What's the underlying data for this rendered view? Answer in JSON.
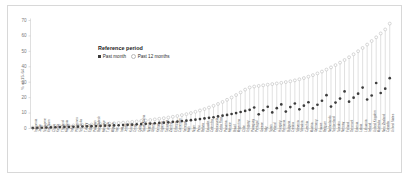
{
  "chart_data": {
    "type": "scatter",
    "title": "",
    "xlabel": "",
    "ylabel": "% of 15-64",
    "ylim": [
      0,
      70
    ],
    "yticks": [
      0,
      10,
      20,
      30,
      40,
      50,
      60,
      70
    ],
    "grid": false,
    "legend": {
      "title": "Reference period",
      "position": "upper-left-inside",
      "entries": [
        {
          "name": "Past month",
          "marker": "filled-square",
          "color": "#3b3b3b"
        },
        {
          "name": "Past 12 months",
          "marker": "open-circle",
          "color": "#b9b9b9"
        }
      ]
    },
    "categories": [
      "Indonesia",
      "Japan",
      "Singapore",
      "Viet Nam",
      "China",
      "Korea",
      "Thailand",
      "Malaysia",
      "India",
      "Philippines",
      "Sri Lanka",
      "Turkey",
      "Egypt",
      "Pakistan",
      "Bangladesh",
      "Morocco",
      "Tunisia",
      "Algeria",
      "Iran",
      "Iraq",
      "Jordan",
      "Kuwait",
      "Oman",
      "Qatar",
      "Saudi Arabia",
      "Nigeria",
      "Ghana",
      "Kenya",
      "Uganda",
      "Tanzania",
      "Zambia",
      "Ethiopia",
      "Cameroon",
      "Senegal",
      "Mali",
      "Niger",
      "Peru",
      "Bolivia",
      "Ecuador",
      "Colombia",
      "Venezuela",
      "Costa Rica",
      "Panama",
      "Mexico",
      "Brazil",
      "Argentina",
      "Chile",
      "Uruguay",
      "Paraguay",
      "Portugal",
      "Greece",
      "Italy",
      "Spain",
      "Poland",
      "Hungary",
      "Romania",
      "Bulgaria",
      "Croatia",
      "Slovenia",
      "Slovakia",
      "Czechia",
      "Austria",
      "Germany",
      "France",
      "Belgium",
      "Netherlands",
      "Switzerland",
      "Sweden",
      "Norway",
      "Finland",
      "Denmark",
      "Estonia",
      "Latvia",
      "Lithuania",
      "Ireland",
      "United Kingdom",
      "Australia",
      "New Zealand",
      "Canada",
      "United States"
    ],
    "series": [
      {
        "name": "Past 12 months",
        "marker": "open-circle",
        "values": [
          0.6,
          0.8,
          1.0,
          1.2,
          1.3,
          1.5,
          1.6,
          1.8,
          1.9,
          2.0,
          2.1,
          2.3,
          2.4,
          2.6,
          2.7,
          2.9,
          3.0,
          3.2,
          3.4,
          3.6,
          3.8,
          4.0,
          4.3,
          4.6,
          4.9,
          5.2,
          5.5,
          5.9,
          6.3,
          6.7,
          7.1,
          7.6,
          8.1,
          8.7,
          9.3,
          10.0,
          10.8,
          11.7,
          12.6,
          13.6,
          14.7,
          15.9,
          17.2,
          18.6,
          20.1,
          21.7,
          23.4,
          25.2,
          26.6,
          27.2,
          27.6,
          28.0,
          28.4,
          28.8,
          29.2,
          29.6,
          30.1,
          30.6,
          31.2,
          31.9,
          32.7,
          33.6,
          34.6,
          35.7,
          36.9,
          38.2,
          39.6,
          41.1,
          42.7,
          44.4,
          46.2,
          48.1,
          50.1,
          52.2,
          54.4,
          56.7,
          59.1,
          61.6,
          64.2,
          68.0
        ]
      },
      {
        "name": "Past month",
        "marker": "filled-circle",
        "values": [
          0.3,
          0.4,
          0.5,
          0.6,
          0.7,
          0.8,
          0.9,
          1.0,
          1.0,
          1.1,
          1.2,
          1.3,
          1.4,
          1.5,
          1.6,
          1.7,
          1.8,
          1.9,
          2.0,
          2.1,
          2.2,
          2.4,
          2.5,
          2.7,
          2.9,
          3.0,
          3.2,
          3.4,
          3.6,
          3.8,
          4.0,
          4.3,
          4.5,
          4.8,
          5.1,
          5.4,
          5.7,
          6.1,
          6.5,
          6.9,
          7.3,
          7.8,
          8.3,
          8.8,
          9.4,
          10.0,
          10.7,
          11.4,
          12.1,
          13.6,
          9.2,
          11.8,
          14.1,
          10.4,
          13.2,
          15.6,
          11.0,
          13.9,
          16.2,
          12.4,
          14.8,
          17.0,
          13.0,
          15.4,
          18.0,
          21.6,
          14.2,
          16.8,
          19.4,
          24.0,
          17.4,
          20.0,
          22.6,
          26.5,
          18.8,
          21.4,
          29.5,
          23.0,
          25.8,
          32.6
        ]
      }
    ]
  }
}
